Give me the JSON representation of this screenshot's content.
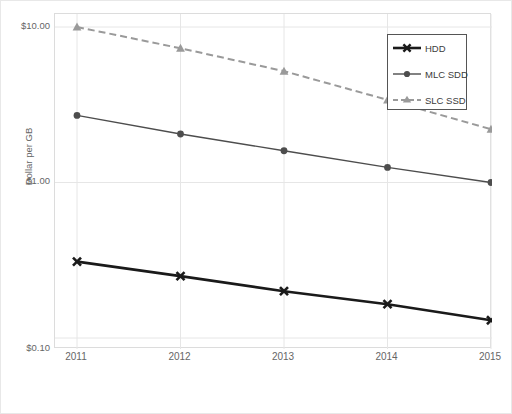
{
  "chart_data": {
    "type": "line",
    "title": "",
    "xlabel": "",
    "ylabel": "Dollar per GB",
    "x": [
      2011,
      2012,
      2013,
      2014,
      2015
    ],
    "categories": [
      "2011",
      "2012",
      "2013",
      "2014",
      "2015"
    ],
    "yscale": "log",
    "ylim": [
      0.1,
      10.0
    ],
    "ytick_values": [
      10.0,
      1.0,
      0.1
    ],
    "ytick_labels": [
      "$10.00",
      "$1.00",
      "$0.10"
    ],
    "grid": true,
    "grid_axis": "both",
    "legend_position": "top-right",
    "series": [
      {
        "name": "HDD",
        "values": [
          0.31,
          0.25,
          0.2,
          0.165,
          0.13
        ],
        "color": "#1a1a1a",
        "linestyle": "solid",
        "linewidth": 2.6,
        "marker": "x-star"
      },
      {
        "name": "MLC SDD",
        "values": [
          2.7,
          2.05,
          1.6,
          1.25,
          1.0
        ],
        "color": "#4d4d4d",
        "linestyle": "solid",
        "linewidth": 1.4,
        "marker": "circle"
      },
      {
        "name": "SLC SSD",
        "values": [
          10.0,
          7.3,
          5.2,
          3.4,
          2.2
        ],
        "color": "#9a9a9a",
        "linestyle": "dashed",
        "linewidth": 2.0,
        "marker": "triangle"
      }
    ]
  },
  "axes": {
    "ylabel": "Dollar per GB",
    "ytick_labels": [
      "$10.00",
      "$1.00",
      "$0.10"
    ],
    "xtick_labels": [
      "2011",
      "2012",
      "2013",
      "2014",
      "2015"
    ]
  },
  "legend": {
    "items": [
      {
        "label": "HDD"
      },
      {
        "label": "MLC SDD"
      },
      {
        "label": "SLC SSD"
      }
    ]
  },
  "colors": {
    "hdd": "#1a1a1a",
    "mlc": "#4d4d4d",
    "slc": "#9a9a9a",
    "grid": "#e6e6e6",
    "frame": "#dcdcdc",
    "text": "#666666"
  }
}
